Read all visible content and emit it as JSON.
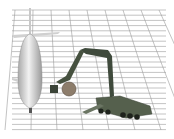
{
  "scene": {
    "description": "3D rendering of an aircraft and a robotic-arm service vehicle on a perspective grid",
    "colors": {
      "background": "#ffffff",
      "grid": "#9a9a9a",
      "aircraft": "#d6d6d6",
      "vehicle": "#4f5a48",
      "arm": "#3f4a3c",
      "tool_disc": "#8a7a6a"
    }
  }
}
